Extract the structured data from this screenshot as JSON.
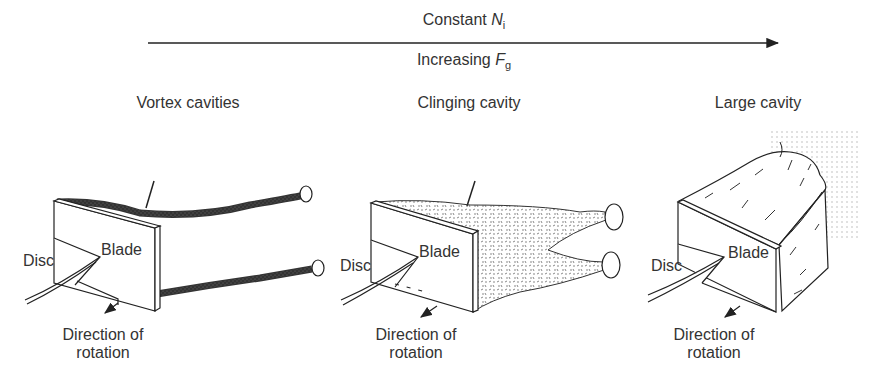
{
  "header": {
    "top_label": "Constant",
    "top_var": "N",
    "top_sub": "i",
    "bottom_label": "Increasing",
    "bottom_var": "F",
    "bottom_sub": "g"
  },
  "panels": [
    {
      "title": "Vortex cavities",
      "disc": "Disc",
      "blade": "Blade",
      "direction_line1": "Direction of",
      "direction_line2": "rotation"
    },
    {
      "title": "Clinging cavity",
      "disc": "Disc",
      "blade": "Blade",
      "direction_line1": "Direction of",
      "direction_line2": "rotation"
    },
    {
      "title": "Large cavity",
      "disc": "Disc",
      "blade": "Blade",
      "direction_line1": "Direction of",
      "direction_line2": "rotation"
    }
  ]
}
